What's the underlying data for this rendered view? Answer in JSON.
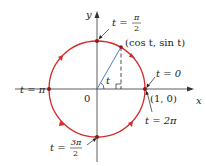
{
  "axes": {
    "x_label": "x",
    "y_label": "y",
    "origin_label": "0"
  },
  "circle_color": "#d42b2b",
  "point_label": "(cos t, sin t)",
  "angle_label": "t",
  "annotations": {
    "t0": "t = 0",
    "t2pi": "t = 2π",
    "tpi": "t = π",
    "tpi2_prefix": "t =",
    "tpi2_num": "π",
    "tpi2_den": "2",
    "t3pi2_prefix": "t =",
    "t3pi2_num": "3π",
    "t3pi2_den": "2",
    "one_zero": "(1, 0)"
  }
}
